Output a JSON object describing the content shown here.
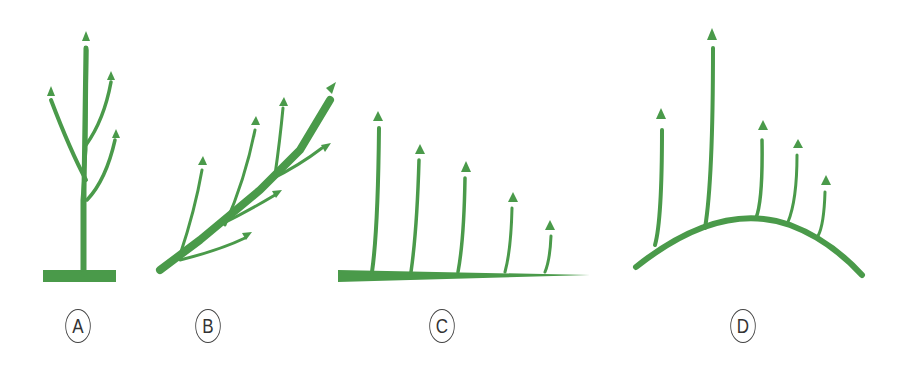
{
  "diagram": {
    "type": "branching growth patterns",
    "color": "#4a9a4a",
    "panels": [
      {
        "label": "A",
        "description": "upright central leader with side branches"
      },
      {
        "label": "B",
        "description": "diagonal branch with shoots"
      },
      {
        "label": "C",
        "description": "horizontal branch with vertical shoots decreasing in height"
      },
      {
        "label": "D",
        "description": "arched branch with vertical shoots, tallest near apex"
      }
    ]
  }
}
